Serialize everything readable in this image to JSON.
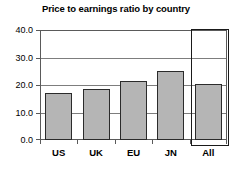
{
  "chart_data": {
    "type": "bar",
    "title": "Price to earnings ratio by country",
    "xlabel": "",
    "ylabel": "",
    "categories": [
      "US",
      "UK",
      "EU",
      "JN",
      "All"
    ],
    "values": [
      17.0,
      18.4,
      21.3,
      25.1,
      20.3
    ],
    "ylim": [
      0.0,
      40.0
    ],
    "ytick_labels": [
      "0.0",
      "10.0",
      "20.0",
      "30.0",
      "40.0"
    ],
    "ytick_values": [
      0.0,
      10.0,
      20.0,
      30.0,
      40.0
    ],
    "grid": true,
    "legend": "none",
    "bar_fill_color": "#b5b5b5",
    "bar_border_color": "#2b2b2b",
    "axis_color": "#5a5a5a",
    "grid_color": "#7d7d7d",
    "background_color": "#ffffff",
    "annotations": [
      {
        "name": "selection-box",
        "type": "highlight-rectangle",
        "category": "All",
        "border_color": "#1a1a1a"
      }
    ]
  }
}
